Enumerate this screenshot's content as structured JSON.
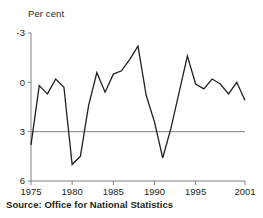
{
  "axis_label_y": "Per cent",
  "source_note": "Source: Office for National Statistics",
  "ticks": {
    "y": [
      "6",
      "3",
      "0",
      "-3"
    ],
    "x": [
      "1975",
      "1980",
      "1985",
      "1990",
      "1995",
      "2001"
    ]
  },
  "colors": {
    "line": "#231f20",
    "axis": "#808080",
    "zero_line": "#808080",
    "text": "#231f20",
    "background": "#ffffff"
  },
  "chart_data": {
    "type": "line",
    "title": "",
    "subtitle": "",
    "xlabel": "",
    "ylabel": "Per cent",
    "xlim": [
      1975,
      2001
    ],
    "ylim": [
      -3,
      6
    ],
    "yticks": [
      -3,
      0,
      3,
      6
    ],
    "xticks": [
      1975,
      1980,
      1985,
      1990,
      1995,
      2001
    ],
    "grid": false,
    "legend": null,
    "series": [
      {
        "name": "Annual percentage change",
        "x": [
          1975,
          1976,
          1977,
          1978,
          1979,
          1980,
          1981,
          1982,
          1983,
          1984,
          1985,
          1986,
          1987,
          1988,
          1989,
          1990,
          1991,
          1992,
          1993,
          1994,
          1995,
          1996,
          1997,
          1998,
          1999,
          2000,
          2001
        ],
        "values": [
          -0.8,
          2.8,
          2.3,
          3.2,
          2.7,
          -2.0,
          -1.5,
          1.6,
          3.6,
          2.4,
          3.5,
          3.7,
          4.4,
          5.2,
          2.2,
          0.6,
          -1.6,
          0.2,
          2.4,
          4.6,
          2.9,
          2.6,
          3.2,
          2.9,
          2.3,
          3.0,
          1.9
        ]
      }
    ]
  }
}
